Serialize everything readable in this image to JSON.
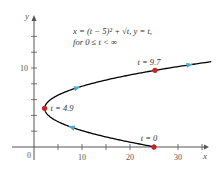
{
  "chart_data": {
    "type": "line",
    "title": "x = (t − 5)² + √t, y = t, for 0 ≤ t < ∞",
    "equation_line1": "x = (t − 5)² + √t, y = t,",
    "equation_line2": "for 0 ≤ t < ∞",
    "xlabel": "x",
    "ylabel": "y",
    "xlim": [
      0,
      35
    ],
    "ylim": [
      0,
      12
    ],
    "x_ticks": [
      10,
      20,
      30
    ],
    "y_ticks": [
      10
    ],
    "origin_label": "0",
    "grid": false,
    "series": [
      {
        "name": "parametric curve",
        "t_range": [
          0,
          10.8
        ],
        "color": "#000000"
      }
    ],
    "marked_points": [
      {
        "label": "t = 0",
        "t": 0,
        "x": 25,
        "y": 0,
        "color": "#cc2222"
      },
      {
        "label": "t = 4.9",
        "t": 4.9,
        "x": 2.2,
        "y": 4.9,
        "color": "#cc2222"
      },
      {
        "label": "t = 9.7",
        "t": 9.7,
        "x": 25.2,
        "y": 9.7,
        "color": "#cc2222"
      }
    ],
    "direction_arrows": [
      {
        "t": 2.5,
        "color": "#4aa8d8"
      },
      {
        "t": 7.5,
        "color": "#4aa8d8"
      },
      {
        "t": 10.4,
        "color": "#4aa8d8"
      }
    ]
  }
}
